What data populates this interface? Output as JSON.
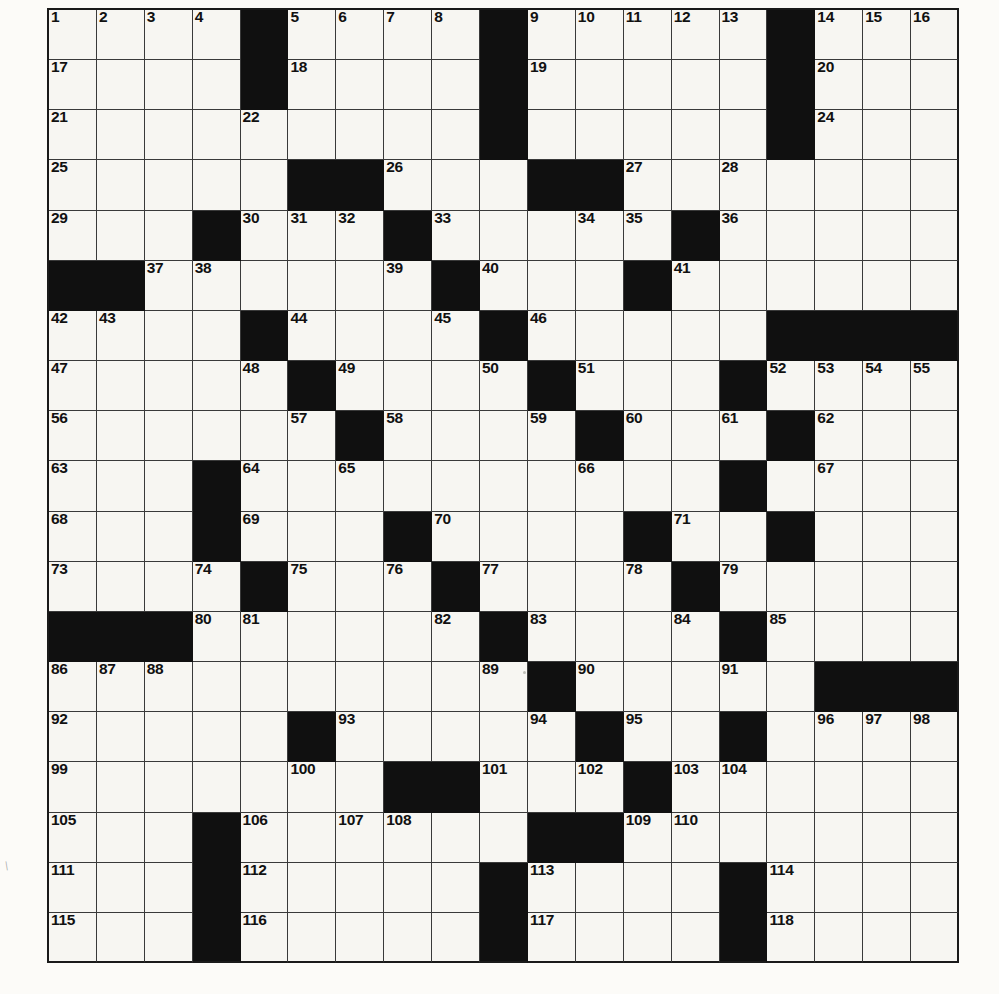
{
  "puzzle": {
    "type": "crossword-grid",
    "rows": 19,
    "cols": 19,
    "colors": {
      "block": "#101010",
      "cell": "#f7f6f2",
      "grid_line": "#3a3a3a",
      "number_text": "#111111",
      "page": "#fcfbf8"
    },
    "max_clue_number": 118,
    "blocks": [
      [
        4,
        9,
        15
      ],
      [
        4,
        9,
        15
      ],
      [
        9,
        15
      ],
      [
        5,
        6,
        10,
        11
      ],
      [
        3,
        7,
        13
      ],
      [
        0,
        1,
        8,
        12
      ],
      [
        4,
        9,
        15,
        16,
        17,
        18
      ],
      [
        5,
        10,
        14
      ],
      [
        6,
        11,
        15
      ],
      [
        3,
        14
      ],
      [
        3,
        7,
        12,
        15
      ],
      [
        4,
        8,
        13
      ],
      [
        0,
        1,
        2,
        9,
        14
      ],
      [
        10,
        16,
        17,
        18
      ],
      [
        5,
        11,
        14
      ],
      [
        7,
        8,
        12
      ],
      [
        3,
        10,
        11
      ],
      [
        3,
        9,
        14
      ],
      [
        3,
        9,
        14
      ]
    ],
    "numbers": [
      [
        [
          0,
          "1"
        ],
        [
          1,
          "2"
        ],
        [
          2,
          "3"
        ],
        [
          3,
          "4"
        ],
        [
          5,
          "5"
        ],
        [
          6,
          "6"
        ],
        [
          7,
          "7"
        ],
        [
          8,
          "8"
        ],
        [
          10,
          "9"
        ],
        [
          11,
          "10"
        ],
        [
          12,
          "11"
        ],
        [
          13,
          "12"
        ],
        [
          14,
          "13"
        ],
        [
          16,
          "14"
        ],
        [
          17,
          "15"
        ],
        [
          18,
          "16"
        ]
      ],
      [
        [
          0,
          "17"
        ],
        [
          5,
          "18"
        ],
        [
          10,
          "19"
        ],
        [
          16,
          "20"
        ]
      ],
      [
        [
          0,
          "21"
        ],
        [
          4,
          "22"
        ],
        [
          9,
          "23"
        ],
        [
          16,
          "24"
        ]
      ],
      [
        [
          0,
          "25"
        ],
        [
          7,
          "26"
        ],
        [
          12,
          "27"
        ],
        [
          14,
          "28"
        ]
      ],
      [
        [
          0,
          "29"
        ],
        [
          4,
          "30"
        ],
        [
          5,
          "31"
        ],
        [
          6,
          "32"
        ],
        [
          8,
          "33"
        ],
        [
          11,
          "34"
        ],
        [
          12,
          "35"
        ],
        [
          14,
          "36"
        ]
      ],
      [
        [
          2,
          "37"
        ],
        [
          3,
          "38"
        ],
        [
          7,
          "39"
        ],
        [
          9,
          "40"
        ],
        [
          13,
          "41"
        ]
      ],
      [
        [
          0,
          "42"
        ],
        [
          1,
          "43"
        ],
        [
          5,
          "44"
        ],
        [
          8,
          "45"
        ],
        [
          10,
          "46"
        ]
      ],
      [
        [
          0,
          "47"
        ],
        [
          4,
          "48"
        ],
        [
          6,
          "49"
        ],
        [
          9,
          "50"
        ],
        [
          11,
          "51"
        ],
        [
          15,
          "52"
        ],
        [
          16,
          "53"
        ],
        [
          17,
          "54"
        ],
        [
          18,
          "55"
        ]
      ],
      [
        [
          0,
          "56"
        ],
        [
          5,
          "57"
        ],
        [
          7,
          "58"
        ],
        [
          10,
          "59"
        ],
        [
          12,
          "60"
        ],
        [
          14,
          "61"
        ],
        [
          16,
          "62"
        ]
      ],
      [
        [
          0,
          "63"
        ],
        [
          4,
          "64"
        ],
        [
          6,
          "65"
        ],
        [
          11,
          "66"
        ],
        [
          16,
          "67"
        ]
      ],
      [
        [
          0,
          "68"
        ],
        [
          4,
          "69"
        ],
        [
          8,
          "70"
        ],
        [
          13,
          "71"
        ],
        [
          15,
          "72"
        ]
      ],
      [
        [
          0,
          "73"
        ],
        [
          3,
          "74"
        ],
        [
          5,
          "75"
        ],
        [
          7,
          "76"
        ],
        [
          9,
          "77"
        ],
        [
          12,
          "78"
        ],
        [
          14,
          "79"
        ]
      ],
      [
        [
          3,
          "80"
        ],
        [
          4,
          "81"
        ],
        [
          8,
          "82"
        ],
        [
          10,
          "83"
        ],
        [
          13,
          "84"
        ],
        [
          15,
          "85"
        ]
      ],
      [
        [
          0,
          "86"
        ],
        [
          1,
          "87"
        ],
        [
          2,
          "88"
        ],
        [
          9,
          "89"
        ],
        [
          11,
          "90"
        ],
        [
          14,
          "91"
        ]
      ],
      [
        [
          0,
          "92"
        ],
        [
          6,
          "93"
        ],
        [
          10,
          "94"
        ],
        [
          12,
          "95"
        ],
        [
          16,
          "96"
        ],
        [
          17,
          "97"
        ],
        [
          18,
          "98"
        ]
      ],
      [
        [
          0,
          "99"
        ],
        [
          5,
          "100"
        ],
        [
          9,
          "101"
        ],
        [
          11,
          "102"
        ],
        [
          13,
          "103"
        ],
        [
          14,
          "104"
        ]
      ],
      [
        [
          0,
          "105"
        ],
        [
          4,
          "106"
        ],
        [
          6,
          "107"
        ],
        [
          7,
          "108"
        ],
        [
          12,
          "109"
        ],
        [
          13,
          "110"
        ]
      ],
      [
        [
          0,
          "111"
        ],
        [
          4,
          "112"
        ],
        [
          10,
          "113"
        ],
        [
          15,
          "114"
        ]
      ],
      [
        [
          0,
          "115"
        ],
        [
          4,
          "116"
        ],
        [
          10,
          "117"
        ],
        [
          15,
          "118"
        ]
      ]
    ]
  }
}
